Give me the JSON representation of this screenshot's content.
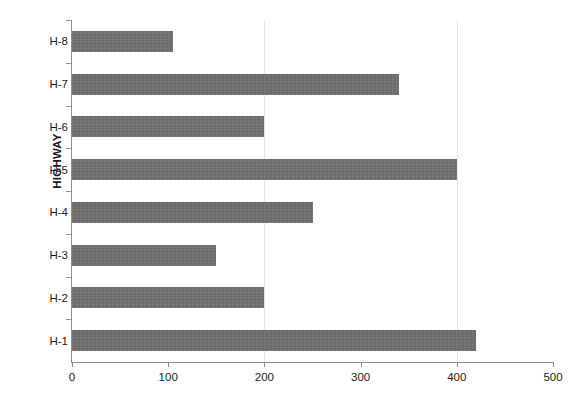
{
  "chart_data": {
    "type": "bar",
    "orientation": "horizontal",
    "title": "",
    "xlabel": "",
    "ylabel": "HIGHWAY",
    "categories": [
      "H-1",
      "H-2",
      "H-3",
      "H-4",
      "H-5",
      "H-6",
      "H-7",
      "H-8"
    ],
    "values": [
      420,
      200,
      150,
      250,
      400,
      200,
      340,
      105
    ],
    "xlim": [
      0,
      500
    ],
    "xticks": [
      0,
      100,
      200,
      300,
      400,
      500
    ],
    "xtick_labels": [
      "0",
      "100",
      "200",
      "300",
      "400",
      "500"
    ],
    "gridlines": [
      200,
      400
    ],
    "grid": true,
    "legend": null,
    "bar_color": "#6e6e6e",
    "axis_color": "#8d8d8d",
    "gridline_color": "#e4e4e4",
    "background_color": "#ffffff"
  },
  "axis_titles": {
    "y": "HIGHWAY"
  }
}
